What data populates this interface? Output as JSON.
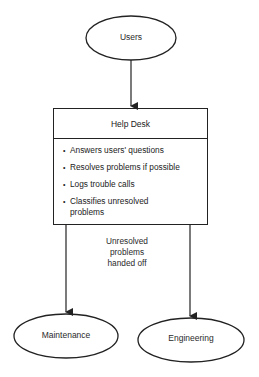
{
  "nodes": {
    "users": {
      "label": "Users"
    },
    "help_desk": {
      "title": "Help Desk",
      "items": [
        "Answers users' questions",
        "Resolves problems if possible",
        "Logs trouble calls",
        "Classifies unresolved problems"
      ]
    },
    "maintenance": {
      "label": "Maintenance"
    },
    "engineering": {
      "label": "Engineering"
    }
  },
  "edges": {
    "handoff_label": [
      "Unresolved",
      "problems",
      "handed off"
    ]
  },
  "colors": {
    "stroke": "#222222",
    "text": "#2a2a2a",
    "background": "#ffffff"
  }
}
